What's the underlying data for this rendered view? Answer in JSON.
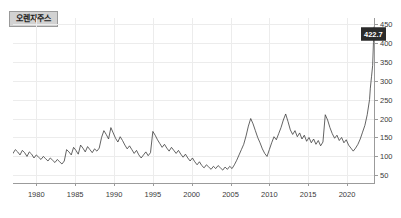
{
  "chart_data": {
    "type": "line",
    "title": "오렌지주스",
    "xlabel": "",
    "ylabel": "",
    "grid": true,
    "legend_position": "top-left",
    "y_axis_side": "right",
    "xlim": [
      1977,
      2023.6
    ],
    "ylim": [
      30,
      465
    ],
    "xticks": [
      1980,
      1985,
      1990,
      1995,
      2000,
      2005,
      2010,
      2015,
      2020
    ],
    "xtick_labels": [
      "1980",
      "1985",
      "1990",
      "1995",
      "2000",
      "2005",
      "2010",
      "2015",
      "2020"
    ],
    "yticks": [
      50,
      100,
      150,
      200,
      250,
      300,
      350,
      400,
      450
    ],
    "ytick_labels": [
      "50",
      "100",
      "150",
      "200",
      "250",
      "300",
      "350",
      "400",
      "450"
    ],
    "last_value_label": "422.7",
    "last_value": 422.7,
    "line_color": "#3c3c3c",
    "grid_color": "#ececec",
    "axis_color": "#9b9b9b",
    "badge_color": "#2b2b2b",
    "chip_bg_color": "#d2d2d2",
    "series": [
      {
        "name": "오렌지주스",
        "x": [
          1977.0,
          1977.3,
          1977.6,
          1977.9,
          1978.2,
          1978.5,
          1978.8,
          1979.1,
          1979.4,
          1979.7,
          1980.0,
          1980.3,
          1980.6,
          1980.9,
          1981.2,
          1981.5,
          1981.8,
          1982.1,
          1982.4,
          1982.7,
          1983.0,
          1983.3,
          1983.6,
          1983.9,
          1984.2,
          1984.5,
          1984.8,
          1985.1,
          1985.4,
          1985.7,
          1986.0,
          1986.3,
          1986.6,
          1986.9,
          1987.2,
          1987.5,
          1987.8,
          1988.1,
          1988.4,
          1988.7,
          1989.0,
          1989.3,
          1989.6,
          1989.9,
          1990.2,
          1990.5,
          1990.8,
          1991.1,
          1991.4,
          1991.7,
          1992.0,
          1992.3,
          1992.6,
          1992.9,
          1993.2,
          1993.5,
          1993.8,
          1994.1,
          1994.4,
          1994.7,
          1995.0,
          1995.3,
          1995.6,
          1995.9,
          1996.2,
          1996.5,
          1996.8,
          1997.1,
          1997.4,
          1997.7,
          1998.0,
          1998.3,
          1998.6,
          1998.9,
          1999.2,
          1999.5,
          1999.8,
          2000.1,
          2000.4,
          2000.7,
          2001.0,
          2001.3,
          2001.6,
          2001.9,
          2002.2,
          2002.5,
          2002.8,
          2003.1,
          2003.4,
          2003.7,
          2004.0,
          2004.3,
          2004.6,
          2004.9,
          2005.2,
          2005.5,
          2005.8,
          2006.1,
          2006.4,
          2006.7,
          2007.0,
          2007.3,
          2007.6,
          2007.9,
          2008.2,
          2008.5,
          2008.8,
          2009.1,
          2009.4,
          2009.7,
          2010.0,
          2010.3,
          2010.6,
          2010.9,
          2011.2,
          2011.5,
          2011.8,
          2012.1,
          2012.4,
          2012.7,
          2013.0,
          2013.3,
          2013.6,
          2013.9,
          2014.2,
          2014.5,
          2014.8,
          2015.1,
          2015.4,
          2015.7,
          2016.0,
          2016.3,
          2016.6,
          2016.9,
          2017.2,
          2017.5,
          2017.8,
          2018.1,
          2018.4,
          2018.7,
          2019.0,
          2019.3,
          2019.6,
          2019.9,
          2020.2,
          2020.5,
          2020.8,
          2021.1,
          2021.4,
          2021.7,
          2022.0,
          2022.3,
          2022.6,
          2022.9,
          2023.0,
          2023.15,
          2023.3,
          2023.4,
          2023.5,
          2023.55
        ],
        "y": [
          108,
          118,
          112,
          104,
          116,
          110,
          100,
          112,
          106,
          96,
          104,
          98,
          92,
          100,
          94,
          88,
          96,
          90,
          84,
          92,
          86,
          80,
          88,
          118,
          112,
          104,
          124,
          116,
          106,
          130,
          122,
          112,
          126,
          118,
          110,
          120,
          114,
          122,
          150,
          168,
          158,
          146,
          176,
          162,
          148,
          138,
          152,
          142,
          130,
          120,
          128,
          118,
          108,
          116,
          104,
          96,
          104,
          112,
          102,
          110,
          166,
          156,
          144,
          134,
          124,
          132,
          122,
          114,
          124,
          116,
          108,
          116,
          106,
          98,
          106,
          96,
          88,
          96,
          86,
          78,
          86,
          76,
          70,
          78,
          72,
          66,
          74,
          68,
          76,
          70,
          64,
          72,
          66,
          74,
          68,
          78,
          90,
          104,
          118,
          132,
          154,
          180,
          200,
          186,
          168,
          150,
          136,
          120,
          108,
          100,
          118,
          136,
          152,
          144,
          160,
          176,
          196,
          212,
          192,
          170,
          158,
          168,
          152,
          162,
          146,
          156,
          140,
          150,
          136,
          146,
          132,
          142,
          128,
          138,
          210,
          196,
          176,
          160,
          148,
          156,
          142,
          150,
          136,
          144,
          130,
          122,
          114,
          122,
          132,
          146,
          164,
          182,
          210,
          250,
          280,
          310,
          340,
          400,
          442,
          422.7
        ]
      }
    ],
    "annotations": [
      {
        "type": "last-value-badge",
        "text": "422.7",
        "value": 422.7
      }
    ]
  }
}
